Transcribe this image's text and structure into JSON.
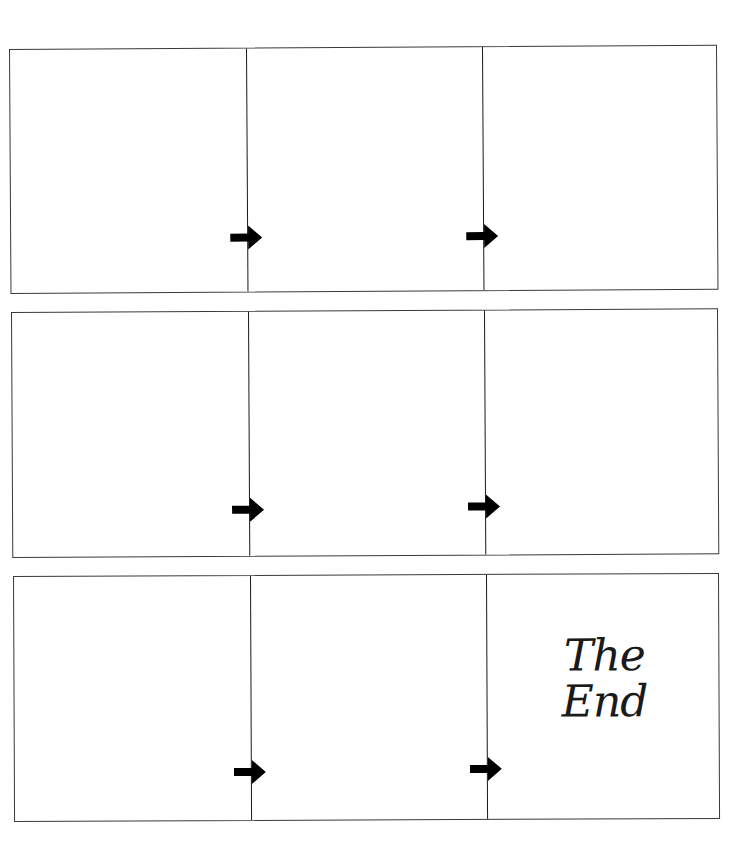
{
  "layout": {
    "strips": 3,
    "panels_per_strip": 3,
    "colors": {
      "background": "#ffffff",
      "border": "#3a3a3a",
      "arrow": "#000000",
      "text": "#1a1a1a"
    }
  },
  "strips": [
    {
      "panels": [
        {
          "content": ""
        },
        {
          "content": ""
        },
        {
          "content": ""
        }
      ],
      "arrows": [
        "arrow-right",
        "arrow-right"
      ]
    },
    {
      "panels": [
        {
          "content": ""
        },
        {
          "content": ""
        },
        {
          "content": ""
        }
      ],
      "arrows": [
        "arrow-right",
        "arrow-right"
      ]
    },
    {
      "panels": [
        {
          "content": ""
        },
        {
          "content": ""
        },
        {
          "content": "The End"
        }
      ],
      "arrows": [
        "arrow-right",
        "arrow-right"
      ]
    }
  ],
  "ending": {
    "line1": "The",
    "line2": "End"
  }
}
